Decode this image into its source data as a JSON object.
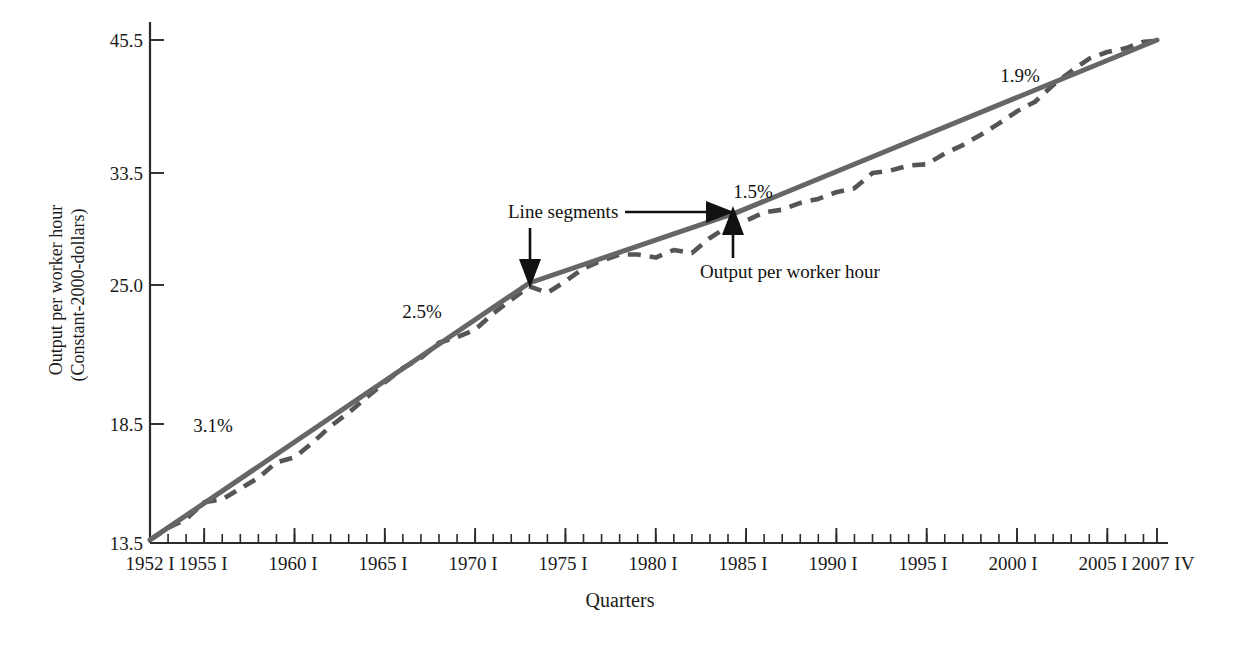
{
  "chart_data": {
    "type": "line",
    "title": "",
    "xlabel": "Quarters",
    "ylabel": "Output per worker hour",
    "ylabel_line2": "(Constant-2000-dollars)",
    "yscale": "log",
    "grid": false,
    "legend": "none",
    "ylim": [
      13.5,
      45.5
    ],
    "ytick_labels": [
      "45.5",
      "33.5",
      "25.0",
      "18.5",
      "13.5"
    ],
    "ytick_values": [
      45.5,
      33.5,
      25.0,
      18.5,
      13.5
    ],
    "xtick_labels": [
      "1952 I",
      "1955 I",
      "1960 I",
      "1965 I",
      "1970 I",
      "1975 I",
      "1980 I",
      "1985 I",
      "1990 I",
      "1995 I",
      "2000 I",
      "2005 I",
      "2007 IV"
    ],
    "xtick_years": [
      1952,
      1955,
      1960,
      1965,
      1970,
      1975,
      1980,
      1985,
      1990,
      1995,
      2000,
      2005,
      2007.75
    ],
    "xlim": [
      1952,
      2007.75
    ],
    "minor_tick_interval_years": 1,
    "series": [
      {
        "name": "Output per worker hour",
        "style": "dashed",
        "color": "#555555",
        "x": [
          1952,
          1953,
          1954,
          1955,
          1956,
          1957,
          1958,
          1959,
          1960,
          1961,
          1962,
          1963,
          1964,
          1965,
          1966,
          1967,
          1968,
          1969,
          1970,
          1971,
          1972,
          1973,
          1974,
          1975,
          1976,
          1977,
          1978,
          1979,
          1980,
          1981,
          1982,
          1983,
          1984,
          1985,
          1986,
          1987,
          1988,
          1989,
          1990,
          1991,
          1992,
          1993,
          1994,
          1995,
          1996,
          1997,
          1998,
          1999,
          2000,
          2001,
          2002,
          2003,
          2004,
          2005,
          2006,
          2007,
          2007.75
        ],
        "values": [
          13.6,
          14.0,
          14.3,
          14.9,
          15.0,
          15.4,
          15.8,
          16.4,
          16.6,
          17.2,
          17.9,
          18.5,
          19.2,
          19.9,
          20.6,
          21.1,
          21.9,
          22.2,
          22.6,
          23.5,
          24.3,
          25.1,
          24.7,
          25.4,
          26.2,
          26.7,
          27.1,
          27.1,
          26.9,
          27.4,
          27.2,
          28.2,
          29.0,
          29.4,
          30.0,
          30.2,
          30.7,
          31.0,
          31.5,
          31.8,
          33.0,
          33.2,
          33.6,
          33.7,
          34.6,
          35.3,
          36.2,
          37.2,
          38.3,
          39.2,
          40.8,
          42.2,
          43.5,
          44.2,
          44.6,
          45.3,
          45.4
        ]
      },
      {
        "name": "Line segments",
        "style": "solid",
        "color": "#666666",
        "breakpoints_x": [
          1952,
          1973,
          1984.5,
          2007.75
        ],
        "breakpoints_y": [
          13.6,
          25.3,
          30.0,
          45.5
        ]
      }
    ],
    "annotations": [
      {
        "id": "growth-1",
        "text": "3.1%",
        "segment": "1952-1973"
      },
      {
        "id": "growth-2",
        "text": "2.5%",
        "segment": "1952-1973"
      },
      {
        "id": "growth-3",
        "text": "1.5%",
        "segment": "1973-1984"
      },
      {
        "id": "growth-4",
        "text": "1.9%",
        "segment": "1984-2007"
      },
      {
        "id": "callout-line-segments",
        "text": "Line segments"
      },
      {
        "id": "callout-output",
        "text": "Output per worker hour"
      }
    ],
    "colors": {
      "trend_line": "#666666",
      "data_line": "#555555",
      "axis": "#2b2b2b",
      "text": "#111111",
      "background": "#ffffff"
    }
  },
  "axes": {
    "y_title_line1": "Output per worker hour",
    "y_title_line2": "(Constant-2000-dollars)",
    "x_title": "Quarters"
  },
  "ticks": {
    "y": [
      {
        "label": "45.5",
        "y": 40
      },
      {
        "label": "33.5",
        "y": 173
      },
      {
        "label": "25.0",
        "y": 285
      },
      {
        "label": "18.5",
        "y": 424
      },
      {
        "label": "13.5",
        "y": 543
      }
    ],
    "x": [
      {
        "label": "1952 I",
        "x": 150
      },
      {
        "label": "1955 I",
        "x": 203
      },
      {
        "label": "1960 I",
        "x": 293
      },
      {
        "label": "1965 I",
        "x": 383
      },
      {
        "label": "1970 I",
        "x": 473
      },
      {
        "label": "1975 I",
        "x": 563
      },
      {
        "label": "1980 I",
        "x": 653
      },
      {
        "label": "1985 I",
        "x": 743
      },
      {
        "label": "1990 I",
        "x": 833
      },
      {
        "label": "1995 I",
        "x": 923
      },
      {
        "label": "2000 I",
        "x": 1013
      },
      {
        "label": "2005 I",
        "x": 1103
      },
      {
        "label": "2007 IV",
        "x": 1157
      }
    ]
  },
  "labels": {
    "pct_1": "3.1%",
    "pct_2": "2.5%",
    "pct_3": "1.5%",
    "pct_4": "1.9%",
    "callout_segments": "Line segments",
    "callout_output": "Output per worker hour"
  }
}
